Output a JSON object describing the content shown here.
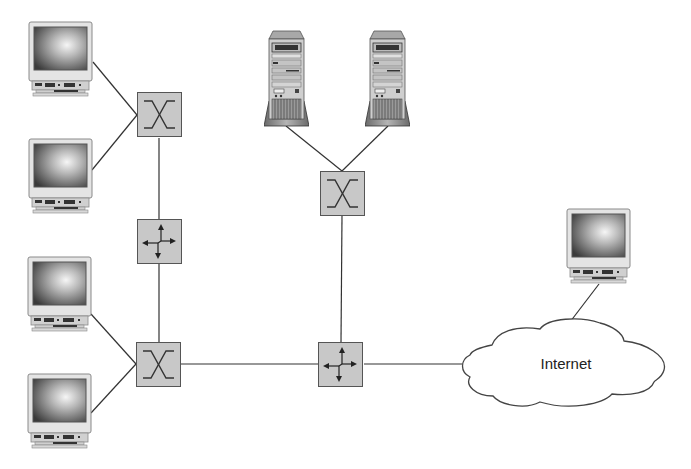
{
  "diagram": {
    "type": "network-topology",
    "colors": {
      "line": "#333333",
      "device_fill": "#c8c8c8",
      "device_stroke": "#555555",
      "monitor_case": "#e2e2e2",
      "screen_dark": "#3a3a3a",
      "screen_light": "#f4f4f4",
      "cloud_fill": "#ffffff"
    },
    "nodes": [
      {
        "id": "pc1",
        "kind": "workstation",
        "icon": "monitor-icon"
      },
      {
        "id": "pc2",
        "kind": "workstation",
        "icon": "monitor-icon"
      },
      {
        "id": "pc3",
        "kind": "workstation",
        "icon": "monitor-icon"
      },
      {
        "id": "pc4",
        "kind": "workstation",
        "icon": "monitor-icon"
      },
      {
        "id": "pc5",
        "kind": "workstation",
        "icon": "monitor-icon"
      },
      {
        "id": "server1",
        "kind": "server",
        "icon": "tower-server-icon"
      },
      {
        "id": "server2",
        "kind": "server",
        "icon": "tower-server-icon"
      },
      {
        "id": "switch1",
        "kind": "switch",
        "icon": "switch-icon"
      },
      {
        "id": "switch2",
        "kind": "switch",
        "icon": "switch-icon"
      },
      {
        "id": "switch3",
        "kind": "switch",
        "icon": "switch-icon"
      },
      {
        "id": "router1",
        "kind": "router",
        "icon": "router-icon"
      },
      {
        "id": "router2",
        "kind": "router",
        "icon": "router-icon"
      },
      {
        "id": "internet",
        "kind": "cloud",
        "icon": "cloud-icon",
        "label": "Internet"
      }
    ],
    "edges": [
      [
        "pc1",
        "switch1"
      ],
      [
        "pc2",
        "switch1"
      ],
      [
        "switch1",
        "router1"
      ],
      [
        "router1",
        "switch2"
      ],
      [
        "pc3",
        "switch2"
      ],
      [
        "pc4",
        "switch2"
      ],
      [
        "switch2",
        "router2"
      ],
      [
        "server1",
        "switch3"
      ],
      [
        "server2",
        "switch3"
      ],
      [
        "switch3",
        "router2"
      ],
      [
        "router2",
        "internet"
      ],
      [
        "internet",
        "pc5"
      ]
    ],
    "cloud_label": "Internet"
  }
}
